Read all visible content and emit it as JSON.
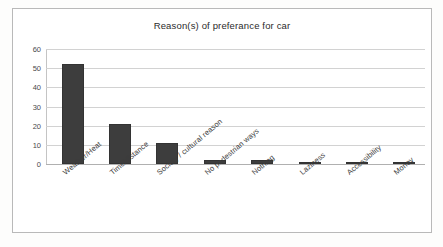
{
  "chart_data": {
    "type": "bar",
    "title": "Reason(s) of preferance for car",
    "xlabel": "",
    "ylabel": "",
    "categories": [
      "Weather/Heat",
      "Time/distance",
      "Society / cultural reason",
      "No pedestrian ways",
      "Nothing",
      "Laziness",
      "Accessibility",
      "Money"
    ],
    "values": [
      52,
      21,
      11,
      2,
      2,
      1,
      1,
      0.3
    ],
    "ylim": [
      0,
      60
    ],
    "yticks": [
      0,
      10,
      20,
      30,
      40,
      50,
      60
    ],
    "ytick_labels": [
      "0",
      "10",
      "20",
      "30",
      "40",
      "50",
      "60"
    ],
    "grid": "horizontal",
    "legend": "none",
    "bar_color": "#3d3d3d",
    "gridline_color": "#d2d2d2",
    "title_color": "#2b2b2b",
    "plot_background": "#ffffff",
    "label_rotation_degrees": -40
  }
}
